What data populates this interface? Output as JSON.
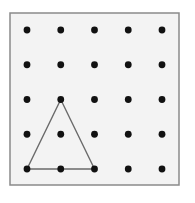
{
  "diagram": {
    "type": "geoboard",
    "rows": 5,
    "cols": 5,
    "board": {
      "x": 10,
      "y": 13,
      "width": 169,
      "height": 172,
      "fill": "#f3f3f3",
      "stroke": "#8a8a8a"
    },
    "grid": {
      "origin_x": 27,
      "origin_y": 30,
      "spacing_x": 33.75,
      "spacing_y": 34.75,
      "dot_radius": 3.4,
      "dot_color": "#111111"
    },
    "shape": {
      "name": "triangle",
      "vertices": [
        {
          "col": 1,
          "row": 2
        },
        {
          "col": 0,
          "row": 4
        },
        {
          "col": 2,
          "row": 4
        }
      ],
      "stroke": "#6a6a6a",
      "stroke_width": 1.4
    }
  }
}
